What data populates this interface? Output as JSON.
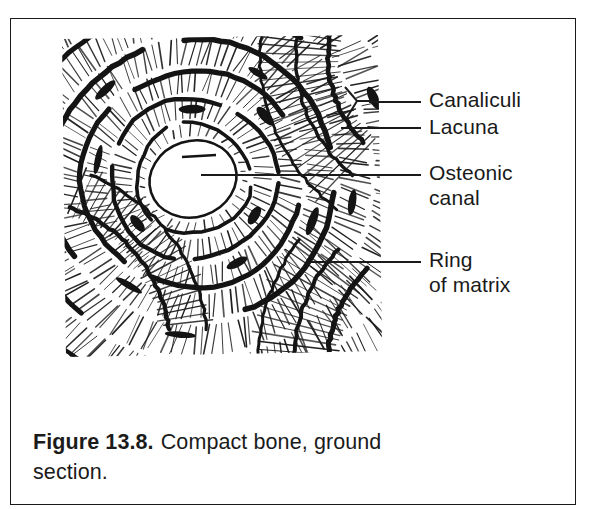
{
  "figure": {
    "frame_border_color": "#1a1a1a",
    "background_color": "#ffffff",
    "ink_color": "#1a1a1a",
    "caption": {
      "label": "Figure 13.8.",
      "text": "Compact bone, ground section."
    },
    "illustration": {
      "alt": "Ground section of compact bone showing an osteon with concentric lamellae (rings of matrix) around a central osteonic canal, lacunae and radiating canaliculi",
      "subject": "osteon-cross-section",
      "central_canal_shape": "irregular-oval",
      "concentric_rings": 5,
      "hatching_style": "radial-line-engraving"
    },
    "callouts": [
      {
        "id": "canaliculi",
        "label": "Canaliculi",
        "leader_y": 82,
        "leader_x": 358,
        "leader_width": 52,
        "label_x": 418,
        "label_y": 68,
        "forked": true
      },
      {
        "id": "lacuna",
        "label": "Lacuna",
        "leader_y": 108,
        "leader_x": 330,
        "leader_width": 80,
        "label_x": 418,
        "label_y": 95,
        "forked": false
      },
      {
        "id": "osteonic-canal",
        "label": "Osteonic\ncanal",
        "leader_y": 155,
        "leader_x": 190,
        "leader_width": 220,
        "label_x": 418,
        "label_y": 141,
        "forked": false
      },
      {
        "id": "ring-of-matrix",
        "label": "Ring\nof matrix",
        "leader_y": 242,
        "leader_x": 300,
        "leader_width": 110,
        "label_x": 418,
        "label_y": 228,
        "forked": false
      }
    ]
  }
}
